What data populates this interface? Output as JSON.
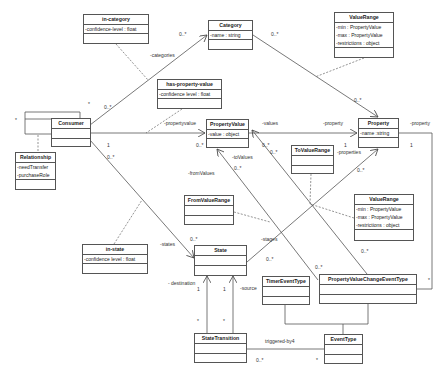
{
  "diagram": {
    "type": "UML class diagram",
    "classes": {
      "in_category": {
        "name": "in-category",
        "attributes": [
          "-confidence-level : float"
        ]
      },
      "category": {
        "name": "Category",
        "attributes": [
          "-name : string"
        ]
      },
      "value_range_top": {
        "name": "ValueRange",
        "attributes": [
          "-min : PropertyValue",
          "-max : PropertyValue",
          "-restrictions : object"
        ]
      },
      "has_property_value": {
        "name": "has-property-value",
        "attributes": [
          "-confidence level : float"
        ]
      },
      "consumer": {
        "name": "Consumer",
        "attributes": []
      },
      "relationship": {
        "name": "Relationship",
        "attributes": [
          "-needTransfer",
          "-purchaseRole"
        ]
      },
      "property_value": {
        "name": "PropertyValue",
        "attributes": [
          "-value : object"
        ]
      },
      "property": {
        "name": "Property",
        "attributes": [
          "-name :string"
        ]
      },
      "to_value_range": {
        "name": "ToValueRange",
        "attributes": []
      },
      "from_value_range": {
        "name": "FromValueRange",
        "attributes": []
      },
      "value_range_mid": {
        "name": "ValueRange",
        "attributes": [
          "-min : PropertyValue",
          "-max : PropertyValue",
          "-restrictions : object"
        ]
      },
      "in_state": {
        "name": "in-state",
        "attributes": [
          "-confidence level : float"
        ]
      },
      "state": {
        "name": "State",
        "attributes": []
      },
      "timer_event_type": {
        "name": "TimerEventType",
        "attributes": []
      },
      "pvc_event_type": {
        "name": "PropertyValueChangeEventType",
        "attributes": []
      },
      "state_transition": {
        "name": "StateTransition",
        "attributes": []
      },
      "event_type": {
        "name": "EventType",
        "attributes": []
      }
    },
    "labels": {
      "categories": "-categories",
      "propertyvalue": "-propertyvalue",
      "values": "-values",
      "property_left": "-property",
      "property_right": "-property",
      "properties": "-properties",
      "to_values": "-toValues",
      "from_values": "-fromValues",
      "states": "-states",
      "stages": "-stages",
      "destination": "- destination",
      "source": "-source",
      "triggered_by": "triggered-by4"
    },
    "multiplicities": {
      "consumer_self_left": "*",
      "consumer_self_top": "*",
      "consumer_to_category_src": "0..*",
      "consumer_to_category_dst": "0..*",
      "category_to_property_src": "0..*",
      "category_to_property_dst": "0..*",
      "consumer_to_pv_src": "1",
      "pv_dst": "0..*",
      "consumer_to_state_src": "0..*",
      "state_dst": "0..*",
      "pv_values_a": "0..*",
      "pv_values_b": "0..*",
      "to_values": "0..*",
      "property_1a": "1",
      "property_1b": "1",
      "properties_dst": "0..*",
      "stages_src": "0..*",
      "pvc_a": "0..*",
      "pvc_b": "0..*",
      "pvc_right": "*",
      "destination_1": "1",
      "source_1": "1",
      "st_star_a": "*",
      "st_star_b": "*",
      "triggered_src": "0..*",
      "triggered_dst": "*"
    }
  }
}
